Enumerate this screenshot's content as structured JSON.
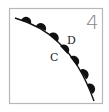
{
  "panel": {
    "number": "4",
    "labels": {
      "upper_side": "D",
      "lower_side": "C"
    },
    "frame_color": "#b8b8b8",
    "line_color": "#111111",
    "marker_color": "#111111",
    "marker_shape": "filled-semicircle",
    "marker_count": 7
  }
}
